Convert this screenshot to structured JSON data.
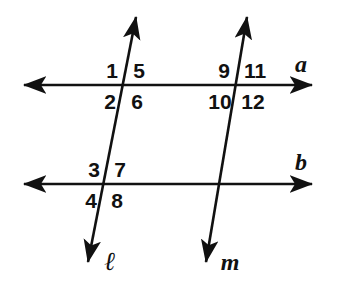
{
  "figure": {
    "width": 346,
    "height": 287,
    "background_color": "#ffffff",
    "stroke_color": "#111111"
  },
  "lines": [
    {
      "id": "line-a",
      "label": "a",
      "kind": "horizontal-double-arrow",
      "label_x": 301,
      "label_y": 64,
      "x1": 24,
      "y1": 85,
      "x2": 312,
      "y2": 85
    },
    {
      "id": "line-b",
      "label": "b",
      "kind": "horizontal-double-arrow",
      "label_x": 301,
      "label_y": 162,
      "x1": 24,
      "y1": 184,
      "x2": 312,
      "y2": 184
    },
    {
      "id": "line-l",
      "label": "ℓ",
      "kind": "transversal-double-arrow",
      "label_x": 110,
      "label_y": 262,
      "x1": 136,
      "y1": 17,
      "x2": 88,
      "y2": 262
    },
    {
      "id": "line-m",
      "label": "m",
      "kind": "transversal-double-arrow",
      "label_x": 230,
      "label_y": 262,
      "x1": 247,
      "y1": 17,
      "x2": 206,
      "y2": 262
    }
  ],
  "intersections": [
    {
      "id": "l-and-a",
      "x": 125,
      "y": 85
    },
    {
      "id": "m-and-a",
      "x": 237,
      "y": 85
    },
    {
      "id": "l-and-b",
      "x": 106,
      "y": 184
    },
    {
      "id": "m-and-b",
      "x": 222,
      "y": 184
    }
  ],
  "angle_labels": [
    {
      "id": "angle-1",
      "text": "1",
      "x": 112,
      "y": 70,
      "at": "l-and-a",
      "position": "upper-left"
    },
    {
      "id": "angle-5",
      "text": "5",
      "x": 139,
      "y": 70,
      "at": "l-and-a",
      "position": "upper-right"
    },
    {
      "id": "angle-2",
      "text": "2",
      "x": 110,
      "y": 101,
      "at": "l-and-a",
      "position": "lower-left"
    },
    {
      "id": "angle-6",
      "text": "6",
      "x": 137,
      "y": 101,
      "at": "l-and-a",
      "position": "lower-right"
    },
    {
      "id": "angle-9",
      "text": "9",
      "x": 224,
      "y": 70,
      "at": "m-and-a",
      "position": "upper-left"
    },
    {
      "id": "angle-11",
      "text": "11",
      "x": 255,
      "y": 70,
      "at": "m-and-a",
      "position": "upper-right"
    },
    {
      "id": "angle-10",
      "text": "10",
      "x": 220,
      "y": 101,
      "at": "m-and-a",
      "position": "lower-left"
    },
    {
      "id": "angle-12",
      "text": "12",
      "x": 253,
      "y": 101,
      "at": "m-and-a",
      "position": "lower-right"
    },
    {
      "id": "angle-3",
      "text": "3",
      "x": 94,
      "y": 169,
      "at": "l-and-b",
      "position": "upper-left"
    },
    {
      "id": "angle-7",
      "text": "7",
      "x": 120,
      "y": 169,
      "at": "l-and-b",
      "position": "upper-right"
    },
    {
      "id": "angle-4",
      "text": "4",
      "x": 91,
      "y": 200,
      "at": "l-and-b",
      "position": "lower-left"
    },
    {
      "id": "angle-8",
      "text": "8",
      "x": 117,
      "y": 200,
      "at": "l-and-b",
      "position": "lower-right"
    }
  ]
}
